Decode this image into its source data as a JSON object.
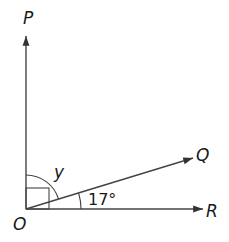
{
  "diagram": {
    "points": {
      "P": "P",
      "Q": "Q",
      "R": "R",
      "O": "O"
    },
    "angle_labels": {
      "y": "y",
      "qor": "17°"
    },
    "colors": {
      "line": "#333333",
      "text": "#1a1a1a"
    }
  }
}
